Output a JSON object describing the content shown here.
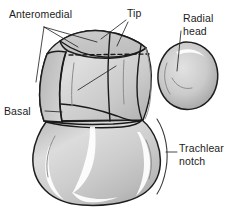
{
  "figure": {
    "background_color": "#ffffff",
    "ink_color": "#1c1c1c",
    "bone_fill_light": "#e4e4e4",
    "bone_fill_mid": "#cfcfcf",
    "bone_fill_dark": "#a9a9a9",
    "outline_color": "#1e1e1e"
  },
  "labels": {
    "anteromedial": "Anteromedial",
    "tip": "Tip",
    "basal": "Basal",
    "radial_head_line1": "Radial",
    "radial_head_line2": "head",
    "trachlear_notch_line1": "Trachlear",
    "trachlear_notch_line2": "notch"
  },
  "structures": {
    "coronoid": "coronoid-process",
    "olecranon": "olecranon-trochlear-notch",
    "radial_head": "radial-head"
  }
}
